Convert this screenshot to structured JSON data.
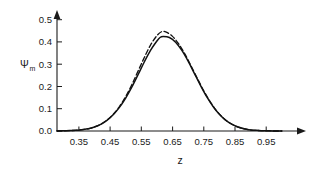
{
  "chart_data": {
    "type": "line",
    "title": "",
    "subtitle": "",
    "xlabel": "z",
    "ylabel": "Ψ",
    "ylabel_subscript": "m",
    "xlim": [
      0.28,
      1.02
    ],
    "ylim": [
      0.0,
      0.53
    ],
    "grid": false,
    "legend": null,
    "xticks": [
      0.35,
      0.45,
      0.55,
      0.65,
      0.75,
      0.85,
      0.95
    ],
    "xticklabels": [
      "0.35",
      "0.45",
      "0.55",
      "0.65",
      "0.75",
      "0.85",
      "0.95"
    ],
    "yticks": [
      0.0,
      0.1,
      0.2,
      0.3,
      0.4,
      0.5
    ],
    "yticklabels": [
      "0.0",
      "0.1",
      "0.2",
      "0.3",
      "0.4",
      "0.5"
    ],
    "axis_arrows": [
      "x-right",
      "y-top"
    ],
    "series": [
      {
        "name": "solid-curve",
        "style": "solid",
        "color": "#111111",
        "peak_x": 0.61,
        "peak_y": 0.425,
        "x": [
          0.28,
          0.3,
          0.32,
          0.34,
          0.36,
          0.38,
          0.4,
          0.42,
          0.44,
          0.46,
          0.48,
          0.5,
          0.52,
          0.54,
          0.56,
          0.58,
          0.6,
          0.61,
          0.62,
          0.64,
          0.66,
          0.68,
          0.7,
          0.72,
          0.74,
          0.76,
          0.78,
          0.8,
          0.82,
          0.84,
          0.86,
          0.88,
          0.9,
          0.92,
          0.94,
          0.96,
          0.98,
          1.0
        ],
        "y": [
          0.0,
          0.001,
          0.002,
          0.003,
          0.006,
          0.01,
          0.018,
          0.03,
          0.048,
          0.073,
          0.106,
          0.148,
          0.198,
          0.254,
          0.311,
          0.363,
          0.404,
          0.42,
          0.424,
          0.42,
          0.399,
          0.362,
          0.314,
          0.259,
          0.204,
          0.153,
          0.11,
          0.075,
          0.049,
          0.031,
          0.018,
          0.01,
          0.005,
          0.003,
          0.001,
          0.001,
          0.0,
          0.0
        ]
      },
      {
        "name": "dashed-curve",
        "style": "dashed",
        "color": "#111111",
        "peak_x": 0.615,
        "peak_y": 0.448,
        "x": [
          0.28,
          0.3,
          0.32,
          0.34,
          0.36,
          0.38,
          0.4,
          0.42,
          0.44,
          0.46,
          0.48,
          0.5,
          0.52,
          0.54,
          0.56,
          0.58,
          0.6,
          0.615,
          0.63,
          0.65,
          0.67,
          0.69,
          0.71,
          0.73,
          0.75,
          0.77,
          0.79,
          0.81,
          0.83,
          0.85,
          0.87,
          0.89,
          0.91,
          0.93,
          0.95,
          0.97,
          0.99,
          1.0
        ],
        "y": [
          0.0,
          0.001,
          0.002,
          0.003,
          0.006,
          0.01,
          0.018,
          0.03,
          0.049,
          0.075,
          0.11,
          0.155,
          0.209,
          0.27,
          0.331,
          0.387,
          0.428,
          0.446,
          0.444,
          0.425,
          0.391,
          0.345,
          0.291,
          0.235,
          0.181,
          0.133,
          0.093,
          0.062,
          0.039,
          0.023,
          0.013,
          0.007,
          0.003,
          0.002,
          0.001,
          0.0,
          0.0,
          0.0
        ]
      }
    ]
  }
}
